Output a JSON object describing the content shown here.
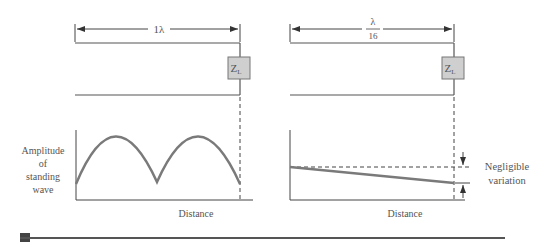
{
  "left_panel": {
    "length_label": "1λ",
    "load_label": "Z",
    "load_subscript": "L",
    "y_axis_label": [
      "Amplitude",
      "of",
      "standing",
      "wave"
    ],
    "x_axis_label": "Distance"
  },
  "right_panel": {
    "length_label_num": "λ",
    "length_label_den": "16",
    "load_label": "Z",
    "load_subscript": "L",
    "x_axis_label": "Distance",
    "annotation": [
      "Negligible",
      "variation"
    ]
  },
  "colors": {
    "curve": "#7a7a7a",
    "line": "#555555",
    "load_fill": "#cfcfcf",
    "footer_bar": "#555555",
    "footer_square": "#444444"
  }
}
